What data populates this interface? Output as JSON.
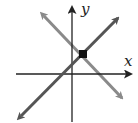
{
  "diagram": {
    "type": "coordinate-plane-two-lines",
    "axes": {
      "x_label": "x",
      "y_label": "y",
      "color": "#222222"
    },
    "lines": [
      {
        "name": "increasing-line",
        "slope_sign": "positive",
        "color": "#555555",
        "arrows": "both-ends"
      },
      {
        "name": "decreasing-line",
        "slope_sign": "negative",
        "color": "#8a8a8a",
        "arrows": "both-ends"
      }
    ],
    "intersection": {
      "marker": "filled-square",
      "color": "#111111",
      "quadrant": "I"
    }
  }
}
